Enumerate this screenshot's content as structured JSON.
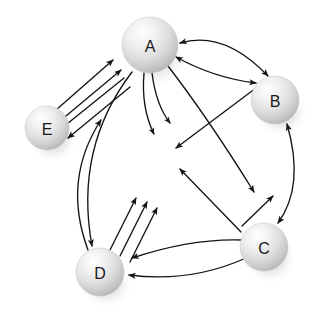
{
  "figure": {
    "name": "directed-graph-diagram",
    "background_color": "#ffffff",
    "edge_color": "#141414",
    "label_color": "#1a1a1a",
    "node_fill_light": "#fdfdfd",
    "node_fill_mid": "#dcdcdc",
    "node_fill_dark": "#b4b4b4",
    "node_shadow_color": "#c8c8c8"
  },
  "nodes": [
    {
      "id": "A",
      "label": "A",
      "cx": 150,
      "cy": 45,
      "r": 28
    },
    {
      "id": "B",
      "label": "B",
      "cx": 275,
      "cy": 100,
      "r": 24
    },
    {
      "id": "C",
      "label": "C",
      "cx": 264,
      "cy": 247,
      "r": 24
    },
    {
      "id": "D",
      "label": "D",
      "cx": 100,
      "cy": 272,
      "r": 24
    },
    {
      "id": "E",
      "label": "E",
      "cx": 47,
      "cy": 128,
      "r": 22
    }
  ],
  "edges": [
    {
      "id": "e1",
      "from": "E",
      "to": "A",
      "style": "straight",
      "heads": "end",
      "note": "parallel bundle 1 of 4, pointing up-right to A"
    },
    {
      "id": "e2",
      "from": "E",
      "to": "A",
      "style": "straight",
      "heads": "end",
      "note": "parallel bundle 2 of 4, pointing up-right to A"
    },
    {
      "id": "e3",
      "from": "A",
      "to": "E",
      "style": "straight",
      "heads": "end",
      "note": "parallel bundle 3 of 4, pointing down-left to E"
    },
    {
      "id": "e4",
      "from": "A",
      "to": "E",
      "style": "straight",
      "heads": "end",
      "note": "parallel bundle 4 of 4, pointing down-left to E"
    },
    {
      "id": "e5",
      "from": "A",
      "to": "B",
      "style": "curved",
      "heads": "both",
      "note": "upper lens curve between A and B"
    },
    {
      "id": "e6",
      "from": "A",
      "to": "B",
      "style": "curved",
      "heads": "both",
      "note": "lower lens curve between A and B"
    },
    {
      "id": "e7",
      "from": "A",
      "to": "center",
      "style": "curved",
      "heads": "end",
      "note": "short curve from A bending down-right"
    },
    {
      "id": "e8",
      "from": "A",
      "to": "center",
      "style": "curved",
      "heads": "end",
      "note": "short curve from A bending down"
    },
    {
      "id": "e9",
      "from": "A",
      "to": "C",
      "style": "curved",
      "heads": "end",
      "note": "long sweep from A down to C"
    },
    {
      "id": "e10",
      "from": "A",
      "to": "D",
      "style": "curved",
      "heads": "end",
      "note": "long left sweep from A past E down to D"
    },
    {
      "id": "e11",
      "from": "B",
      "to": "D",
      "style": "straight",
      "heads": "end",
      "note": "diagonal from B down-left toward D side"
    },
    {
      "id": "e12",
      "from": "B",
      "to": "C",
      "style": "curved",
      "heads": "both",
      "note": "right-side bidirectional curve"
    },
    {
      "id": "e13",
      "from": "C",
      "to": "B",
      "style": "straight",
      "heads": "end",
      "note": "diagonal up-right to B"
    },
    {
      "id": "e14",
      "from": "C",
      "to": "A",
      "style": "straight",
      "heads": "end",
      "note": "long diagonal up-left toward A region"
    },
    {
      "id": "e15",
      "from": "C",
      "to": "D",
      "style": "curved",
      "heads": "end",
      "note": "upper arc from C to D"
    },
    {
      "id": "e16",
      "from": "C",
      "to": "D",
      "style": "curved",
      "heads": "end",
      "note": "lower arc from C to D"
    },
    {
      "id": "e17",
      "from": "D",
      "to": "B",
      "style": "straight",
      "heads": "end",
      "note": "parallel bundle 1 of 3 from D up-right"
    },
    {
      "id": "e18",
      "from": "D",
      "to": "B",
      "style": "straight",
      "heads": "end",
      "note": "parallel bundle 2 of 3 from D up-right"
    },
    {
      "id": "e19",
      "from": "D",
      "to": "B",
      "style": "straight",
      "heads": "end",
      "note": "parallel bundle 3 of 3 from D up-right"
    },
    {
      "id": "e20",
      "from": "D",
      "to": "E",
      "style": "curved",
      "heads": "end",
      "note": "left arc from D up to E/A region"
    }
  ]
}
